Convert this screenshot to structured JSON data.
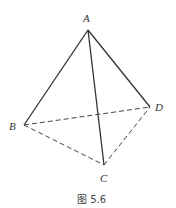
{
  "figure": {
    "caption": "图 5.6",
    "vertices": {
      "A": {
        "label": "A",
        "x": 88,
        "y": 30
      },
      "B": {
        "label": "B",
        "x": 24,
        "y": 125
      },
      "C": {
        "label": "C",
        "x": 104,
        "y": 165
      },
      "D": {
        "label": "D",
        "x": 150,
        "y": 107
      }
    },
    "solid_edges": [
      "AB",
      "AC",
      "AD"
    ],
    "dashed_edges": [
      "BC",
      "BD",
      "CD"
    ],
    "colors": {
      "line": "#333333",
      "background": "#ffffff"
    }
  }
}
